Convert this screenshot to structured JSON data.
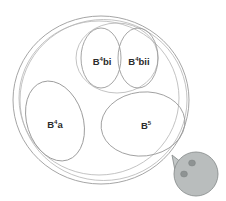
{
  "diagram": {
    "background_color": "#ffffff",
    "outline_color": "#9b9b9b",
    "label_color": "#2b2b2b",
    "outer": {
      "name": "outer-boundary",
      "label": ""
    },
    "regions": [
      {
        "id": "b4a",
        "base": "B",
        "superscript": "4",
        "suffix": "a",
        "label": "B4a"
      },
      {
        "id": "b4bi",
        "base": "B",
        "superscript": "4",
        "suffix": "bi",
        "label": "B4bi"
      },
      {
        "id": "b4bii",
        "base": "B",
        "superscript": "4",
        "suffix": "bii",
        "label": "B4bii"
      },
      {
        "id": "b5",
        "base": "B",
        "superscript": "5",
        "suffix": "",
        "label": "B5"
      }
    ],
    "marker": {
      "name": "ball-marker",
      "body_color": "#b9bdbd",
      "spot_color": "#8e9393",
      "edge_color": "#8b9090",
      "spot_count": 2
    }
  }
}
